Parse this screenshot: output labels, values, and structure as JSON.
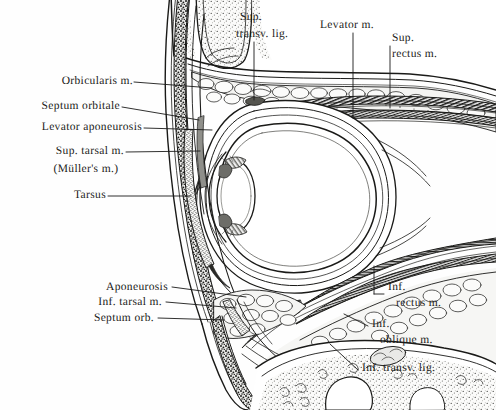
{
  "figure": {
    "background_color": "#fefefe",
    "ink_color": "#1a1a18",
    "fill_light": "#f2f2f0",
    "fill_mid": "#bdbdbd",
    "fill_dark": "#4a4a4a"
  },
  "labels": {
    "orbicularis": "Orbicularis m.",
    "septum_orbitale": "Septum orbitale",
    "levator_aponeurosis": "Levator aponeurosis",
    "sup_tarsal_line1": "Sup. tarsal m.",
    "sup_tarsal_line2": "(Müller's m.)",
    "tarsus": "Tarsus",
    "sup_transv_line1": "Sup.",
    "sup_transv_line2": "transv. lig.",
    "levator": "Levator m.",
    "sup_rectus_line1": "Sup.",
    "sup_rectus_line2": "rectus m.",
    "aponeurosis": "Aponeurosis",
    "inf_tarsal": "Inf. tarsal m.",
    "septum_orb": "Septum orb.",
    "inf_rectus_line1": "Inf.",
    "inf_rectus_line2": "rectus m.",
    "inf_oblique_line1": "Inf.",
    "inf_oblique_line2": "oblique m.",
    "inf_transv_lig": "Inf. transv. lig."
  },
  "structures": [
    {
      "name": "globe",
      "description": "eyeball sclera white oval"
    },
    {
      "name": "lens",
      "description": "crystalline lens anterior oval"
    },
    {
      "name": "upper-eyelid",
      "description": "upper lid with tarsus and orbicularis"
    },
    {
      "name": "lower-eyelid",
      "description": "lower lid with inferior tarsus"
    },
    {
      "name": "orbital-fat",
      "description": "orbital fat lobules"
    },
    {
      "name": "superior-rectus-muscle",
      "description": "striated muscle band superior"
    },
    {
      "name": "inferior-rectus-muscle",
      "description": "striated muscle band inferior"
    },
    {
      "name": "levator-palpebrae-muscle",
      "description": "levator muscle and aponeurosis"
    },
    {
      "name": "orbital-bone-superior",
      "description": "superior orbital rim bone"
    },
    {
      "name": "orbital-bone-inferior",
      "description": "inferior orbital rim / maxilla"
    }
  ]
}
